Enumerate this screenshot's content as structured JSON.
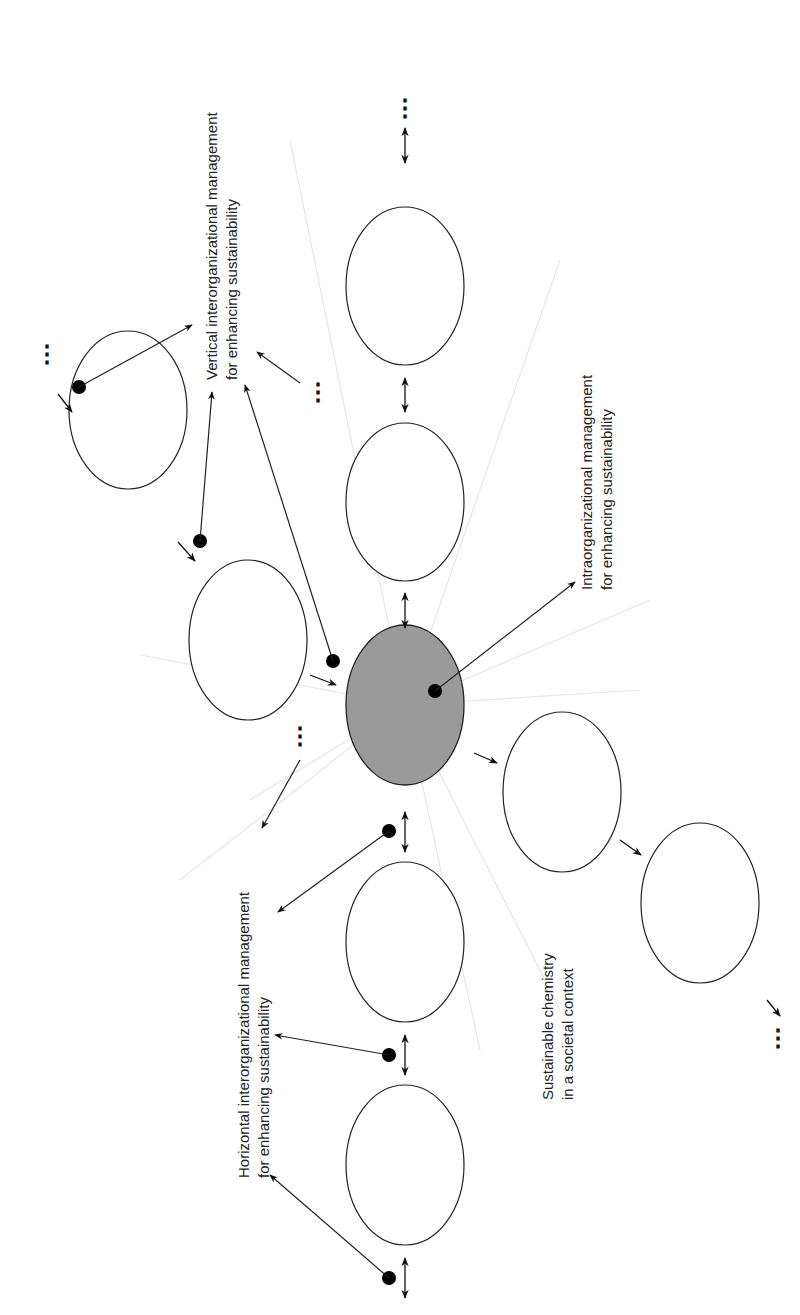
{
  "labels": {
    "vertical": {
      "line1": "Vertical interorganizational management",
      "line2": "for enhancing sustainability"
    },
    "intra": {
      "line1": "Intraorganizational management",
      "line2": "for enhancing sustainability"
    },
    "horizontal": {
      "line1": "Horizontal interorganizational management",
      "line2": "for enhancing sustainability"
    },
    "societal": {
      "line1": "Sustainable chemistry",
      "line2": "in a societal context"
    }
  },
  "continuation_marker": "⋮",
  "colors": {
    "central_fill": "#9a9a9a",
    "stroke": "#222222",
    "faint_rays": "#e4e4e4"
  }
}
